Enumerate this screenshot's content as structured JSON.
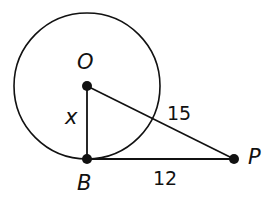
{
  "diagram": {
    "points": [
      {
        "id": "O",
        "label": "O",
        "x": 87,
        "y": 86
      },
      {
        "id": "B",
        "label": "B",
        "x": 87,
        "y": 159
      },
      {
        "id": "P",
        "label": "P",
        "x": 234,
        "y": 159
      }
    ],
    "circle": {
      "center": "O",
      "cx": 87,
      "cy": 86,
      "r": 73
    },
    "segments": [
      {
        "from": "O",
        "to": "B",
        "label": "x"
      },
      {
        "from": "O",
        "to": "P",
        "label": "15"
      },
      {
        "from": "B",
        "to": "P",
        "label": "12"
      }
    ],
    "labels": {
      "O": "O",
      "B": "B",
      "P": "P",
      "OB": "x",
      "OP": "15",
      "BP": "12"
    },
    "stroke_color": "#111111"
  }
}
